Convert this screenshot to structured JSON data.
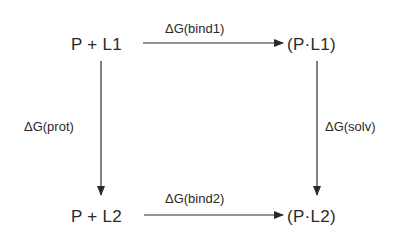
{
  "diagram": {
    "type": "thermodynamic-cycle",
    "nodes": {
      "top_left": "P + L1",
      "top_right": "(P·L1)",
      "bottom_left": "P + L2",
      "bottom_right": "(P·L2)"
    },
    "edges": {
      "top": {
        "label": "ΔG(bind1)",
        "from": "P + L1",
        "to": "(P·L1)"
      },
      "bottom": {
        "label": "ΔG(bind2)",
        "from": "P + L2",
        "to": "(P·L2)"
      },
      "left": {
        "label": "ΔG(prot)",
        "from": "P + L1",
        "to": "P + L2"
      },
      "right": {
        "label": "ΔG(solv)",
        "from": "(P·L1)",
        "to": "(P·L2)"
      }
    },
    "colors": {
      "line": "#2a2a2a",
      "text": "#2a2a2a",
      "background": "#ffffff"
    }
  }
}
